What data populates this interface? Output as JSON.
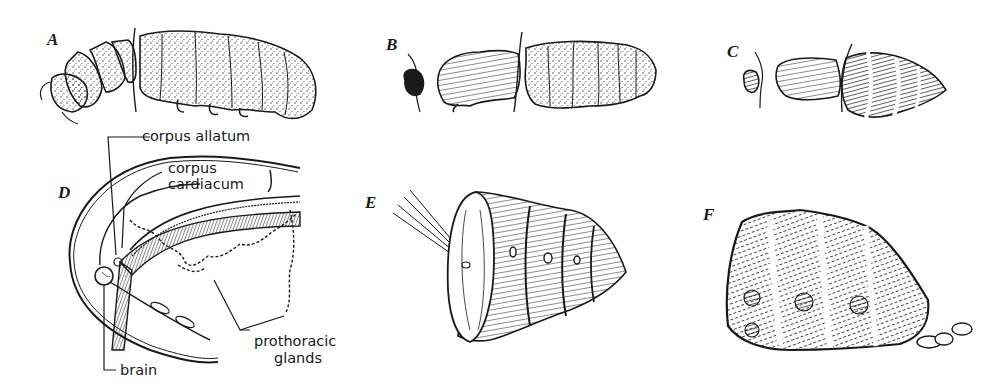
{
  "figure": {
    "panels": [
      {
        "id": "A",
        "letter": "A",
        "description": "larva with ligature between thorax and abdomen, both parts remain larval"
      },
      {
        "id": "B",
        "letter": "B",
        "description": "ligatured larva: anterior part pupates, posterior remains larval"
      },
      {
        "id": "C",
        "letter": "C",
        "description": "ligatured larva: both anterior and posterior parts pupate"
      },
      {
        "id": "D",
        "letter": "D",
        "description": "anatomy of larval head and thorax showing endocrine glands"
      },
      {
        "id": "E",
        "letter": "E",
        "description": "isolated abdomen with pipette inserted"
      },
      {
        "id": "F",
        "letter": "F",
        "description": "isolated abdomen forming puparium"
      }
    ],
    "labels": {
      "corpus_allatum": "corpus allatum",
      "corpus_cardiacum_line1": "corpus",
      "corpus_cardiacum_line2": "cardiacum",
      "prothoracic_glands_line1": "prothoracic",
      "prothoracic_glands_line2": "glands",
      "brain": "brain"
    },
    "colors": {
      "ink": "#1a1a1a",
      "background": "#ffffff"
    }
  }
}
